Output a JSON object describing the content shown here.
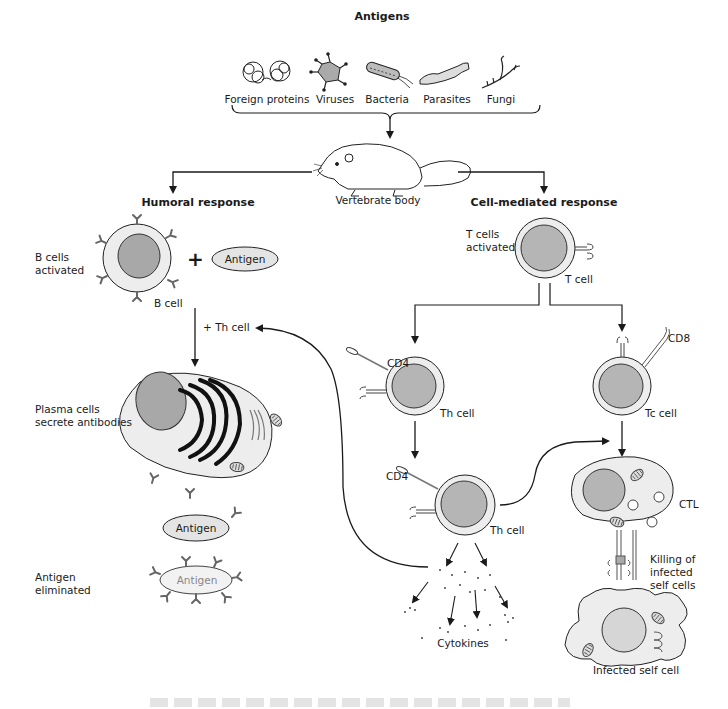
{
  "title": "Antigens",
  "antigen_types": [
    {
      "label": "Foreign proteins",
      "icon": "protein-icon"
    },
    {
      "label": "Viruses",
      "icon": "virus-icon"
    },
    {
      "label": "Bacteria",
      "icon": "bacteria-icon"
    },
    {
      "label": "Parasites",
      "icon": "parasite-icon"
    },
    {
      "label": "Fungi",
      "icon": "fungi-icon"
    }
  ],
  "host": {
    "label": "Vertebrate body",
    "icon": "rat-icon"
  },
  "humoral": {
    "heading": "Humoral response",
    "b_cells_label": "B cells\nactivated",
    "b_cell": "B cell",
    "plus": "+",
    "antigen": "Antigen",
    "th_help": "+ Th cell",
    "plasma_label": "Plasma cells\nsecrete antibodies",
    "antigen2": "Antigen",
    "eliminated_label": "Antigen\neliminated",
    "antigen3": "Antigen"
  },
  "cell_mediated": {
    "heading": "Cell-mediated response",
    "t_cells_label": "T cells\nactivated",
    "t_cell": "T cell",
    "cd4_a": "CD4",
    "th_cell_a": "Th cell",
    "cd8": "CD8",
    "tc_cell": "Tc cell",
    "cd4_b": "CD4",
    "th_cell_b": "Th cell",
    "ctl": "CTL",
    "killing_label": "Killing of\ninfected\nself cells",
    "cytokines": "Cytokines",
    "infected_cell": "Infected self cell"
  },
  "colors": {
    "nucleus": "#a8a8a8",
    "cytoplasm": "#ededed",
    "line": "#1a1a1a",
    "antibody": "#666666"
  }
}
